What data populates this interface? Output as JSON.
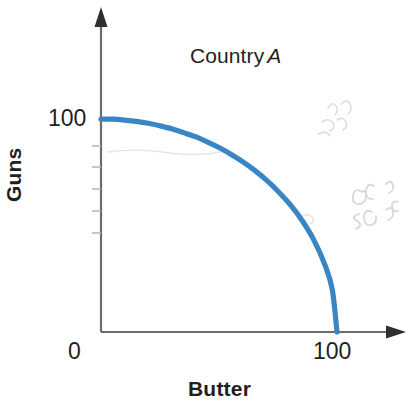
{
  "chart_data": {
    "type": "line",
    "title_plain": "Country",
    "title_emphasis": "A",
    "xlabel": "Butter",
    "ylabel": "Guns",
    "xlim": [
      0,
      115
    ],
    "ylim": [
      0,
      118
    ],
    "grid": false,
    "legend": null,
    "series": [
      {
        "name": "Production possibilities frontier",
        "color": "#3a85c3",
        "x": [
          0,
          5,
          10,
          15,
          20,
          25,
          30,
          35,
          40,
          45,
          50,
          55,
          60,
          65,
          70,
          75,
          80,
          85,
          90,
          95,
          98,
          100
        ],
        "y": [
          100,
          99.9,
          99.5,
          98.9,
          98.0,
          96.8,
          95.4,
          93.6,
          91.7,
          89.3,
          86.6,
          83.5,
          80.0,
          76.0,
          71.4,
          66.1,
          60.0,
          52.7,
          43.6,
          31.2,
          19.9,
          0
        ]
      }
    ],
    "x_ticks": [
      {
        "value": 0,
        "label": "0"
      },
      {
        "value": 100,
        "label": "100"
      }
    ],
    "y_ticks": [
      {
        "value": 100,
        "label": "100"
      },
      {
        "value": 88,
        "label": ""
      },
      {
        "value": 76,
        "label": ""
      },
      {
        "value": 64,
        "label": ""
      },
      {
        "value": 52,
        "label": ""
      },
      {
        "value": 40,
        "label": ""
      }
    ],
    "axis_arrows": {
      "x": true,
      "y": true
    },
    "axis_color": "#6b6b6b",
    "curve_color": "#3a85c3",
    "text_color": "#231f20",
    "background": "#ffffff",
    "annotations": [
      {
        "kind": "erased-pencil-marks",
        "region": "upper-right",
        "text": ""
      },
      {
        "kind": "erased-pencil-marks",
        "region": "mid-right",
        "text": ""
      }
    ]
  },
  "figure": {
    "title_word": "Country",
    "title_letter": "A",
    "y_axis_title": "Guns",
    "x_axis_title": "Butter",
    "y_label_top": "100",
    "x_label_origin": "0",
    "x_label_max": "100"
  }
}
